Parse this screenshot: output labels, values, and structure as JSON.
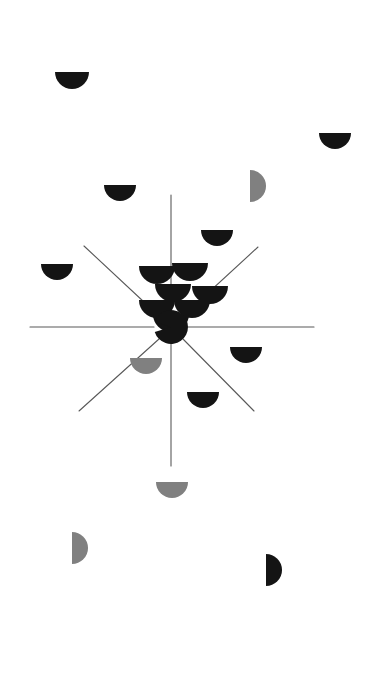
{
  "figure": {
    "width": 369,
    "height": 673,
    "background_color": "#ffffff",
    "colors": {
      "ink_black": "#141414",
      "ink_gray": "#808080",
      "line_gray": "#595959",
      "background": "#ffffff"
    },
    "center": {
      "x": 171,
      "y": 327
    },
    "hub": {
      "name": "center-disc",
      "cx": 171,
      "cy": 327,
      "r": 17,
      "color": "#141414",
      "notch_start_deg": 163,
      "notch_end_deg": 197,
      "notch_description": "wedge cut opening toward the left"
    },
    "rays": [
      {
        "name": "ray-north",
        "x1": 171,
        "y1": 195,
        "x2": 171,
        "y2": 311,
        "color": "#595959",
        "width": 1.1
      },
      {
        "name": "ray-south",
        "x1": 171,
        "y1": 344,
        "x2": 171,
        "y2": 466,
        "color": "#595959",
        "width": 1.1
      },
      {
        "name": "ray-west",
        "x1": 30,
        "y1": 327,
        "x2": 154,
        "y2": 327,
        "color": "#595959",
        "width": 1.1
      },
      {
        "name": "ray-east",
        "x1": 188,
        "y1": 327,
        "x2": 314,
        "y2": 327,
        "color": "#595959",
        "width": 1.1
      },
      {
        "name": "ray-northwest",
        "x1": 84,
        "y1": 246,
        "x2": 159,
        "y2": 316,
        "color": "#595959",
        "width": 1.1
      },
      {
        "name": "ray-northeast",
        "x1": 258,
        "y1": 247,
        "x2": 183,
        "y2": 316,
        "color": "#595959",
        "width": 1.1
      },
      {
        "name": "ray-southwest",
        "x1": 79,
        "y1": 411,
        "x2": 159,
        "y2": 339,
        "color": "#595959",
        "width": 1.1
      },
      {
        "name": "ray-southeast",
        "x1": 254,
        "y1": 411,
        "x2": 183,
        "y2": 339,
        "color": "#595959",
        "width": 1.1
      }
    ],
    "half_discs": [
      {
        "name": "half-disc-outer-1",
        "cx": 72,
        "cy": 72,
        "r": 17,
        "rot": 0,
        "color": "#141414",
        "zone": "outer"
      },
      {
        "name": "half-disc-outer-2",
        "cx": 120,
        "cy": 185,
        "r": 16,
        "rot": 0,
        "color": "#141414",
        "zone": "outer"
      },
      {
        "name": "half-disc-outer-3",
        "cx": 335,
        "cy": 133,
        "r": 16,
        "rot": 0,
        "color": "#141414",
        "zone": "outer"
      },
      {
        "name": "half-disc-outer-4",
        "cx": 250,
        "cy": 186,
        "r": 16,
        "rot": -90,
        "color": "#808080",
        "zone": "outer"
      },
      {
        "name": "half-disc-outer-5",
        "cx": 217,
        "cy": 230,
        "r": 16,
        "rot": 0,
        "color": "#141414",
        "zone": "outer"
      },
      {
        "name": "half-disc-outer-6",
        "cx": 57,
        "cy": 264,
        "r": 16,
        "rot": 0,
        "color": "#141414",
        "zone": "outer"
      },
      {
        "name": "half-disc-outer-7",
        "cx": 146,
        "cy": 358,
        "r": 16,
        "rot": 0,
        "color": "#808080",
        "zone": "outer"
      },
      {
        "name": "half-disc-outer-8",
        "cx": 246,
        "cy": 347,
        "r": 16,
        "rot": 0,
        "color": "#141414",
        "zone": "outer"
      },
      {
        "name": "half-disc-outer-9",
        "cx": 203,
        "cy": 392,
        "r": 16,
        "rot": 0,
        "color": "#141414",
        "zone": "outer"
      },
      {
        "name": "half-disc-outer-10",
        "cx": 172,
        "cy": 482,
        "r": 16,
        "rot": 0,
        "color": "#808080",
        "zone": "outer"
      },
      {
        "name": "half-disc-outer-11",
        "cx": 72,
        "cy": 548,
        "r": 16,
        "rot": -90,
        "color": "#808080",
        "zone": "outer"
      },
      {
        "name": "half-disc-outer-12",
        "cx": 266,
        "cy": 570,
        "r": 16,
        "rot": -90,
        "color": "#141414",
        "zone": "outer"
      },
      {
        "name": "half-disc-cluster-1",
        "cx": 157,
        "cy": 266,
        "r": 18,
        "rot": 0,
        "color": "#141414",
        "zone": "cluster"
      },
      {
        "name": "half-disc-cluster-2",
        "cx": 190,
        "cy": 263,
        "r": 18,
        "rot": 0,
        "color": "#141414",
        "zone": "cluster"
      },
      {
        "name": "half-disc-cluster-3",
        "cx": 173,
        "cy": 284,
        "r": 18,
        "rot": 0,
        "color": "#141414",
        "zone": "cluster"
      },
      {
        "name": "half-disc-cluster-4",
        "cx": 210,
        "cy": 286,
        "r": 18,
        "rot": 0,
        "color": "#141414",
        "zone": "cluster"
      },
      {
        "name": "half-disc-cluster-5",
        "cx": 157,
        "cy": 300,
        "r": 18,
        "rot": 0,
        "color": "#141414",
        "zone": "cluster"
      },
      {
        "name": "half-disc-cluster-6",
        "cx": 192,
        "cy": 300,
        "r": 18,
        "rot": 0,
        "color": "#141414",
        "zone": "cluster"
      },
      {
        "name": "half-disc-cluster-7",
        "cx": 171,
        "cy": 314,
        "r": 18,
        "rot": 0,
        "color": "#141414",
        "zone": "cluster"
      }
    ]
  }
}
